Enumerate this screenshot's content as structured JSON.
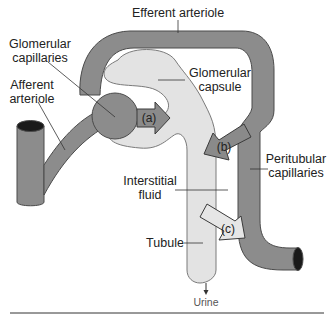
{
  "diagram": {
    "colors": {
      "vessel": "#8c8c8c",
      "vessel_stroke": "#4a4a4a",
      "vessel_lumen": "#1a1a1a",
      "capsule": "#e3e3e3",
      "capsule_stroke": "#7a7a7a",
      "arrow_dark": "#8a8a8a",
      "arrow_light": "#e6e6e6",
      "leader": "#333333",
      "rule": "#333333"
    },
    "labels": {
      "efferent_arteriole": "Efferent arteriole",
      "glomerular_capillaries_1": "Glomerular",
      "glomerular_capillaries_2": "capillaries",
      "afferent_arteriole_1": "Afferent",
      "afferent_arteriole_2": "arteriole",
      "glomerular_capsule_1": "Glomerular",
      "glomerular_capsule_2": "capsule",
      "peritubular_capillaries_1": "Peritubular",
      "peritubular_capillaries_2": "capillaries",
      "interstitial_fluid_1": "Interstitial",
      "interstitial_fluid_2": "fluid",
      "tubule": "Tubule",
      "urine": "Urine"
    },
    "arrows": {
      "a": "(a)",
      "b": "(b)",
      "c": "(c)"
    }
  }
}
